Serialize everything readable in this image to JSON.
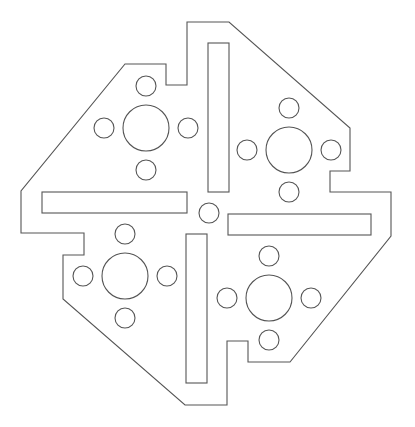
{
  "drawing": {
    "type": "mounting-plate-outline",
    "stroke_color": "#555555",
    "background": "#ffffff",
    "outline_points": "187,22 229,22 350,128 350,171 330,171 330,192 391,192 391,236 290,362 248,362 248,341 227,341 227,405 185,405 63,299 63,255 84,255 84,233 21,233 21,191 125,64 166,64 166,85 187,85",
    "slots": [
      {
        "name": "slot-top",
        "x": 208,
        "y": 43,
        "w": 21,
        "h": 149
      },
      {
        "name": "slot-left",
        "x": 42,
        "y": 192,
        "w": 145,
        "h": 21
      },
      {
        "name": "slot-right",
        "x": 228,
        "y": 214,
        "w": 143,
        "h": 21
      },
      {
        "name": "slot-bottom",
        "x": 186,
        "y": 234,
        "w": 21,
        "h": 149
      }
    ],
    "center_hole": {
      "cx": 209,
      "cy": 213,
      "r": 10
    },
    "hole_groups": [
      {
        "name": "top-left",
        "cx": 146,
        "cy": 128,
        "R": 23,
        "r": 10,
        "offset": 42
      },
      {
        "name": "top-right",
        "cx": 289,
        "cy": 150,
        "R": 23,
        "r": 10,
        "offset": 42
      },
      {
        "name": "bottom-left",
        "cx": 125,
        "cy": 276,
        "R": 23,
        "r": 10,
        "offset": 42
      },
      {
        "name": "bottom-right",
        "cx": 269,
        "cy": 298,
        "R": 23,
        "r": 10,
        "offset": 42
      }
    ]
  }
}
